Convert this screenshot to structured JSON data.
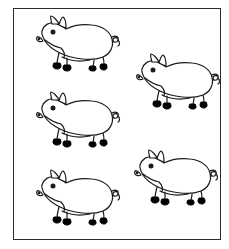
{
  "scene": {
    "title": "Five pigs line drawing",
    "description": "Black-and-white line-art worksheet showing five identical pigs arranged in a staggered pattern inside a thin rectangular frame",
    "subject": "pig",
    "count": 5,
    "colors": {
      "background": "#ffffff",
      "outline": "#1a1a1a",
      "frame": "#2b2b2b",
      "hoof": "#000000",
      "body_fill": "#ffffff"
    },
    "frame": {
      "label": "picture-frame",
      "border_width": 1
    },
    "pigs": [
      {
        "id": "pig-1",
        "label": "pig-top-left",
        "facing": "left",
        "row": 1,
        "column": 1
      },
      {
        "id": "pig-2",
        "label": "pig-upper-right",
        "facing": "left",
        "row": 2,
        "column": 2
      },
      {
        "id": "pig-3",
        "label": "pig-middle-left",
        "facing": "left",
        "row": 3,
        "column": 1
      },
      {
        "id": "pig-4",
        "label": "pig-bottom-left",
        "facing": "left",
        "row": 5,
        "column": 1
      },
      {
        "id": "pig-5",
        "label": "pig-lower-right",
        "facing": "left",
        "row": 4,
        "column": 2
      }
    ],
    "parts": [
      "ear-front",
      "ear-back",
      "eye",
      "snout",
      "nostril",
      "jaw-line",
      "body",
      "belly",
      "foreleg",
      "hindleg",
      "hoof",
      "curly-tail"
    ]
  }
}
